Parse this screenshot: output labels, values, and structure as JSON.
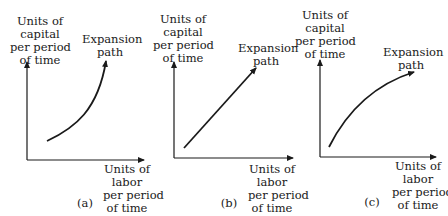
{
  "figure": {
    "panels": [
      {
        "id": "a",
        "caption": "(a)",
        "y_axis_label": [
          "Units of",
          "capital",
          "per period",
          "of time"
        ],
        "x_axis_label": [
          "Units of",
          "labor",
          "per period",
          "of time"
        ],
        "curve_label": [
          "Expansion",
          "path"
        ],
        "curve_shape": "convex (increasing slope)"
      },
      {
        "id": "b",
        "caption": "(b)",
        "y_axis_label": [
          "Units of",
          "capital",
          "per period",
          "of time"
        ],
        "x_axis_label": [
          "Units of",
          "labor",
          "per period",
          "of time"
        ],
        "curve_label": [
          "Expansion",
          "path"
        ],
        "curve_shape": "straight line"
      },
      {
        "id": "c",
        "caption": "(c)",
        "y_axis_label": [
          "Units of",
          "capital",
          "per period",
          "of time"
        ],
        "x_axis_label": [
          "Units of",
          "labor",
          "per period",
          "of time"
        ],
        "curve_label": [
          "Expansion",
          "path"
        ],
        "curve_shape": "concave (decreasing slope)"
      }
    ],
    "colors": {
      "ink": "#1a1a1a",
      "background": "#ffffff"
    }
  }
}
